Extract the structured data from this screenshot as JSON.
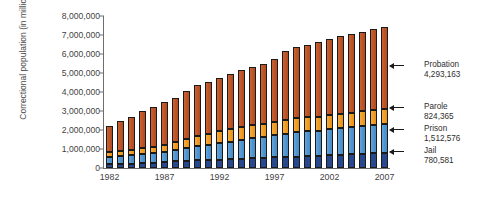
{
  "chart_data": {
    "type": "bar",
    "stacked": true,
    "title": "",
    "xlabel": "",
    "ylabel": "Correctional population (in millions)",
    "ylim": [
      0,
      8000000
    ],
    "ytick_values": [
      0,
      1000000,
      2000000,
      3000000,
      4000000,
      5000000,
      6000000,
      7000000,
      8000000
    ],
    "ytick_labels": [
      "0",
      "1,000,000",
      "2,000,000",
      "3,000,000",
      "4,000,000",
      "5,000,000",
      "6,000,000",
      "7,000,000",
      "8,000,000"
    ],
    "grid": false,
    "legend_position": "right-annotations",
    "categories": [
      1982,
      1983,
      1984,
      1985,
      1986,
      1987,
      1988,
      1989,
      1990,
      1991,
      1992,
      1993,
      1994,
      1995,
      1996,
      1997,
      1998,
      1999,
      2000,
      2001,
      2002,
      2003,
      2004,
      2005,
      2006,
      2007
    ],
    "xtick_labels": [
      "1982",
      "1987",
      "1992",
      "1997",
      "2002",
      "2007"
    ],
    "xtick_values": [
      1982,
      1987,
      1992,
      1997,
      2002,
      2007
    ],
    "series": [
      {
        "name": "Jail",
        "color": "#27488c",
        "values": [
          209582,
          221815,
          234500,
          256615,
          274444,
          295873,
          343569,
          395553,
          405320,
          426479,
          441889,
          455500,
          479800,
          507044,
          518492,
          567079,
          592462,
          605943,
          621149,
          631240,
          665475,
          691301,
          713990,
          747529,
          766010,
          780581
        ]
      },
      {
        "name": "Prison",
        "color": "#5b9bd5",
        "values": [
          395516,
          419820,
          443398,
          480568,
          522084,
          560812,
          603732,
          680907,
          743382,
          792535,
          850566,
          909381,
          990147,
          1078542,
          1127528,
          1176564,
          1224469,
          1287172,
          1316333,
          1330980,
          1367856,
          1390279,
          1421345,
          1448344,
          1492973,
          1512576
        ]
      },
      {
        "name": "Parole",
        "color": "#f0a02a",
        "values": [
          224604,
          246440,
          266992,
          300203,
          325638,
          355505,
          407977,
          456803,
          531407,
          590442,
          658601,
          676100,
          690371,
          679421,
          679733,
          694787,
          696385,
          714457,
          723898,
          732333,
          750934,
          769925,
          771852,
          784408,
          798202,
          824365
        ]
      },
      {
        "name": "Probation",
        "color": "#c0562a",
        "values": [
          1357264,
          1582947,
          1740948,
          1968712,
          2114621,
          2247158,
          2356483,
          2522125,
          2670234,
          2728472,
          2811611,
          2903061,
          2981022,
          3077861,
          3164996,
          3296513,
          3670441,
          3779922,
          3826209,
          3931731,
          4024067,
          4120012,
          4143792,
          4162536,
          4236800,
          4293163
        ]
      }
    ],
    "annotations": [
      {
        "label": "Probation",
        "value": "4,293,163",
        "series": "Probation"
      },
      {
        "label": "Parole",
        "value": "824,365",
        "series": "Parole"
      },
      {
        "label": "Prison",
        "value": "1,512,576",
        "series": "Prison"
      },
      {
        "label": "Jail",
        "value": "780,581",
        "series": "Jail"
      }
    ]
  }
}
